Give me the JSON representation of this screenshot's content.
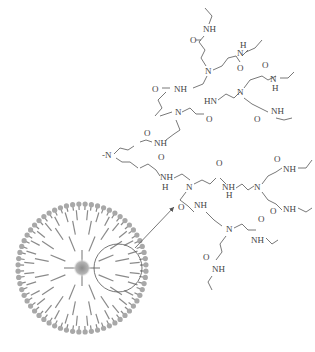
{
  "figure": {
    "type": "dendrimer-schematic",
    "colors": {
      "bond": "#555555",
      "branch": "#8a8a8a",
      "terminal_group": "#a8a8a8",
      "core": "#9a9a9a"
    }
  },
  "structure": {
    "labels": {
      "nh": "NH",
      "hn": "HN",
      "n": "N",
      "o": "O",
      "h": "H",
      "methyl_n": "-N"
    }
  },
  "dendrimer": {
    "core_label": "core",
    "magnifier_label": "magnified branch"
  },
  "caption": {
    "text": ""
  }
}
